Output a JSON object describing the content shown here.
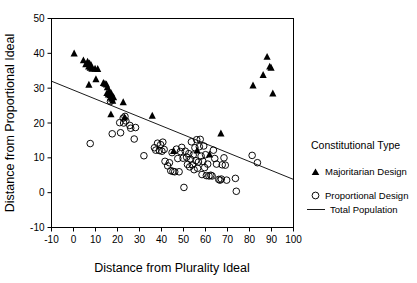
{
  "chart_data": {
    "type": "scatter",
    "title": "",
    "xlabel": "Distance from Plurality Ideal",
    "ylabel": "Distance from Proportional Ideal",
    "xlim": [
      -10,
      100
    ],
    "ylim": [
      -10,
      50
    ],
    "xticks": [
      -10,
      0,
      10,
      20,
      30,
      40,
      50,
      60,
      70,
      80,
      90,
      100
    ],
    "yticks": [
      -10,
      0,
      10,
      20,
      30,
      40,
      50
    ],
    "xtick_labels": [
      "-10",
      "0",
      "10",
      "20",
      "30",
      "40",
      "50",
      "60",
      "70",
      "80",
      "90",
      "100"
    ],
    "ytick_labels": [
      "-10",
      "0",
      "10",
      "20",
      "30",
      "40",
      "50"
    ],
    "grid": false,
    "legend_position": "right",
    "legend_title": "Constitutional Type",
    "series": [
      {
        "name": "Majoritarian Design",
        "marker": "filled-triangle",
        "color": "#000000",
        "points": [
          [
            0.3,
            40.0
          ],
          [
            4.5,
            38.0
          ],
          [
            5.6,
            36.9
          ],
          [
            6.4,
            37.6
          ],
          [
            6.9,
            36.2
          ],
          [
            7.3,
            37.1
          ],
          [
            7.6,
            35.9
          ],
          [
            8.0,
            36.6
          ],
          [
            8.4,
            35.6
          ],
          [
            7.0,
            31.0
          ],
          [
            9.8,
            35.6
          ],
          [
            10.2,
            32.6
          ],
          [
            11.0,
            35.5
          ],
          [
            13.6,
            31.5
          ],
          [
            14.3,
            31.3
          ],
          [
            15.0,
            31.1
          ],
          [
            15.4,
            30.3
          ],
          [
            15.2,
            28.6
          ],
          [
            15.8,
            28.2
          ],
          [
            16.2,
            29.2
          ],
          [
            16.6,
            28.0
          ],
          [
            16.9,
            27.3
          ],
          [
            17.1,
            28.6
          ],
          [
            17.4,
            27.0
          ],
          [
            17.8,
            26.4
          ],
          [
            18.2,
            27.4
          ],
          [
            17.0,
            22.5
          ],
          [
            22.6,
            26.0
          ],
          [
            23.2,
            21.6
          ],
          [
            35.8,
            22.1
          ],
          [
            45.5,
            12.0
          ],
          [
            56.2,
            12.1
          ],
          [
            61.8,
            11.0
          ],
          [
            67.0,
            17.0
          ],
          [
            81.6,
            30.8
          ],
          [
            86.2,
            33.8
          ],
          [
            88.0,
            39.0
          ],
          [
            89.2,
            36.2
          ],
          [
            89.8,
            35.9
          ],
          [
            90.6,
            28.5
          ]
        ]
      },
      {
        "name": "Proportional Design",
        "marker": "open-circle",
        "color": "#000000",
        "points": [
          [
            7.6,
            14.1
          ],
          [
            16.8,
            26.2
          ],
          [
            17.6,
            16.9
          ],
          [
            21.0,
            20.1
          ],
          [
            21.4,
            17.2
          ],
          [
            22.6,
            21.4
          ],
          [
            22.8,
            20.0
          ],
          [
            23.4,
            21.9
          ],
          [
            23.8,
            20.6
          ],
          [
            25.6,
            19.3
          ],
          [
            26.0,
            18.5
          ],
          [
            27.6,
            15.4
          ],
          [
            28.2,
            18.7
          ],
          [
            32.0,
            10.6
          ],
          [
            36.8,
            12.9
          ],
          [
            37.4,
            12.2
          ],
          [
            38.2,
            14.2
          ],
          [
            39.0,
            12.1
          ],
          [
            39.6,
            13.8
          ],
          [
            40.2,
            11.9
          ],
          [
            40.6,
            14.5
          ],
          [
            41.2,
            12.4
          ],
          [
            41.6,
            9.0
          ],
          [
            42.8,
            7.7
          ],
          [
            43.6,
            8.6
          ],
          [
            44.2,
            6.3
          ],
          [
            44.8,
            11.5
          ],
          [
            45.2,
            6.1
          ],
          [
            46.0,
            6.0
          ],
          [
            46.8,
            12.5
          ],
          [
            47.4,
            9.8
          ],
          [
            48.0,
            6.0
          ],
          [
            48.6,
            11.8
          ],
          [
            49.2,
            13.0
          ],
          [
            49.8,
            9.9
          ],
          [
            50.2,
            1.5
          ],
          [
            50.8,
            11.9
          ],
          [
            51.4,
            10.2
          ],
          [
            51.8,
            8.1
          ],
          [
            52.4,
            11.2
          ],
          [
            52.8,
            7.4
          ],
          [
            53.2,
            9.6
          ],
          [
            53.6,
            14.6
          ],
          [
            54.0,
            8.0
          ],
          [
            54.4,
            10.8
          ],
          [
            54.8,
            6.6
          ],
          [
            55.2,
            12.9
          ],
          [
            55.6,
            9.2
          ],
          [
            56.0,
            15.2
          ],
          [
            56.4,
            7.0
          ],
          [
            56.8,
            8.8
          ],
          [
            57.2,
            13.2
          ],
          [
            57.6,
            15.3
          ],
          [
            58.0,
            10.5
          ],
          [
            58.4,
            5.2
          ],
          [
            58.8,
            9.0
          ],
          [
            59.2,
            13.4
          ],
          [
            59.6,
            7.2
          ],
          [
            60.0,
            10.9
          ],
          [
            60.4,
            4.9
          ],
          [
            61.0,
            8.2
          ],
          [
            61.6,
            4.8
          ],
          [
            62.4,
            5.0
          ],
          [
            63.0,
            4.8
          ],
          [
            63.6,
            12.2
          ],
          [
            64.2,
            9.8
          ],
          [
            65.0,
            8.2
          ],
          [
            66.0,
            3.8
          ],
          [
            66.6,
            3.6
          ],
          [
            67.2,
            3.9
          ],
          [
            67.6,
            8.0
          ],
          [
            68.4,
            10.0
          ],
          [
            69.0,
            7.9
          ],
          [
            69.6,
            3.6
          ],
          [
            73.6,
            4.1
          ],
          [
            74.0,
            0.4
          ],
          [
            81.2,
            10.7
          ],
          [
            83.6,
            8.6
          ]
        ]
      }
    ],
    "trendline": {
      "name": "Total Population",
      "x0": -10,
      "y0": 32.0,
      "x1": 100,
      "y1": 3.8
    }
  },
  "legend": {
    "title": "Constitutional Type",
    "entries": [
      {
        "label": "Majoritarian Design",
        "marker": "filled-triangle"
      },
      {
        "label": "Proportional Design",
        "marker": "open-circle"
      },
      {
        "label": "Total Population",
        "marker": "line"
      }
    ]
  }
}
